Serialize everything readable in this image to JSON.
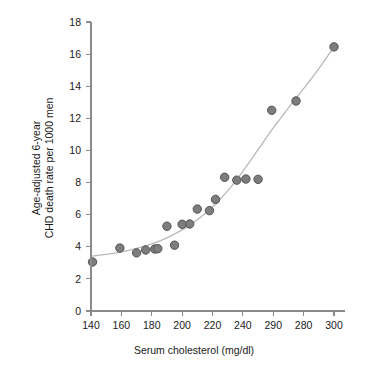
{
  "chart_data": {
    "type": "scatter",
    "title": "",
    "xlabel": "Serum cholesterol (mg/dl)",
    "ylabel_line1": "Age-adjusted 6-year",
    "ylabel_line2": "CHD death rate per 1000 men",
    "xlim": [
      140,
      300
    ],
    "ylim": [
      0,
      18
    ],
    "grid": false,
    "legend": null,
    "xticks": [
      "140",
      "160",
      "180",
      "200",
      "220",
      "240",
      "290",
      "280",
      "300"
    ],
    "xtick_values": [
      140,
      160,
      180,
      200,
      220,
      240,
      260,
      280,
      300
    ],
    "yticks": [
      "0",
      "2",
      "4",
      "6",
      "8",
      "10",
      "12",
      "14",
      "16",
      "18"
    ],
    "ytick_values": [
      0,
      2,
      4,
      6,
      8,
      10,
      12,
      14,
      16,
      18
    ],
    "marker_fill": "#7d7d7d",
    "marker_edge": "#545454",
    "curve_color": "#b9b9b9",
    "axis_color": "#8a8a8a",
    "points": [
      {
        "x": 141,
        "y": 3.05
      },
      {
        "x": 159,
        "y": 3.92
      },
      {
        "x": 170,
        "y": 3.62
      },
      {
        "x": 176,
        "y": 3.8
      },
      {
        "x": 182,
        "y": 3.86
      },
      {
        "x": 184,
        "y": 3.88
      },
      {
        "x": 190,
        "y": 5.28
      },
      {
        "x": 195,
        "y": 4.1
      },
      {
        "x": 200,
        "y": 5.4
      },
      {
        "x": 205,
        "y": 5.42
      },
      {
        "x": 210,
        "y": 6.35
      },
      {
        "x": 218,
        "y": 6.25
      },
      {
        "x": 222,
        "y": 6.95
      },
      {
        "x": 228,
        "y": 8.33
      },
      {
        "x": 236,
        "y": 8.15
      },
      {
        "x": 242,
        "y": 8.22
      },
      {
        "x": 250,
        "y": 8.2
      },
      {
        "x": 259,
        "y": 12.5
      },
      {
        "x": 275,
        "y": 13.08
      },
      {
        "x": 300,
        "y": 16.45
      }
    ],
    "fit_curve": [
      {
        "x": 140,
        "y": 3.42
      },
      {
        "x": 150,
        "y": 3.52
      },
      {
        "x": 160,
        "y": 3.68
      },
      {
        "x": 170,
        "y": 3.9
      },
      {
        "x": 180,
        "y": 4.18
      },
      {
        "x": 190,
        "y": 4.56
      },
      {
        "x": 200,
        "y": 5.05
      },
      {
        "x": 210,
        "y": 5.68
      },
      {
        "x": 220,
        "y": 6.48
      },
      {
        "x": 230,
        "y": 7.48
      },
      {
        "x": 240,
        "y": 8.7
      },
      {
        "x": 250,
        "y": 10.05
      },
      {
        "x": 260,
        "y": 11.4
      },
      {
        "x": 270,
        "y": 12.65
      },
      {
        "x": 280,
        "y": 13.85
      },
      {
        "x": 290,
        "y": 15.1
      },
      {
        "x": 300,
        "y": 16.45
      }
    ]
  }
}
